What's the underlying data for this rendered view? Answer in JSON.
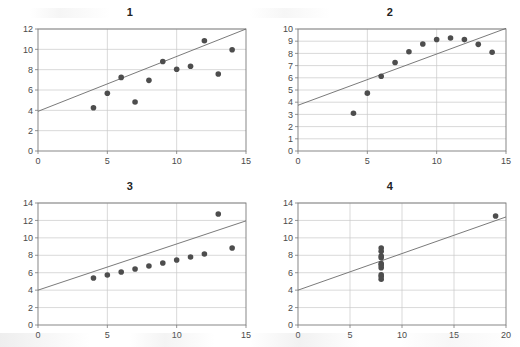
{
  "figure": {
    "name": "anscombes-quartet",
    "background_color": "#ffffff",
    "marker_color": "#4d4d4d",
    "line_color": "#6b6b6b",
    "grid_color": "#c8c8c8",
    "axis_color": "#7a7a7a"
  },
  "chart_data": [
    {
      "type": "scatter",
      "title": "1",
      "xlabel": "",
      "ylabel": "",
      "xlim": [
        0,
        15
      ],
      "ylim": [
        0,
        12
      ],
      "xticks": [
        0,
        5,
        10,
        15
      ],
      "yticks": [
        0,
        2,
        4,
        6,
        8,
        10,
        12
      ],
      "grid": true,
      "legend": "none",
      "x": [
        10,
        8,
        13,
        9,
        11,
        14,
        6,
        4,
        12,
        7,
        5
      ],
      "y": [
        8.04,
        6.95,
        7.58,
        8.81,
        8.33,
        9.96,
        7.24,
        4.26,
        10.84,
        4.82,
        5.68
      ],
      "fit_line": {
        "intercept": 3.9,
        "slope": 0.54,
        "x_from": 0,
        "x_to": 15
      }
    },
    {
      "type": "scatter",
      "title": "2",
      "xlabel": "",
      "ylabel": "",
      "xlim": [
        0,
        15
      ],
      "ylim": [
        0,
        10
      ],
      "xticks": [
        0,
        5,
        10,
        15
      ],
      "yticks": [
        0,
        1,
        2,
        3,
        4,
        5,
        6,
        7,
        8,
        9,
        10
      ],
      "grid": true,
      "legend": "none",
      "x": [
        10,
        8,
        13,
        9,
        11,
        14,
        6,
        4,
        12,
        7,
        5
      ],
      "y": [
        9.14,
        8.14,
        8.74,
        8.77,
        9.26,
        8.1,
        6.13,
        3.1,
        9.13,
        7.26,
        4.74
      ],
      "fit_line": {
        "intercept": 3.75,
        "slope": 0.42,
        "x_from": 0,
        "x_to": 15
      }
    },
    {
      "type": "scatter",
      "title": "3",
      "xlabel": "",
      "ylabel": "",
      "xlim": [
        0,
        15
      ],
      "ylim": [
        0,
        14
      ],
      "xticks": [
        0,
        5,
        10,
        15
      ],
      "yticks": [
        0,
        2,
        4,
        6,
        8,
        10,
        12,
        14
      ],
      "grid": true,
      "legend": "none",
      "x": [
        10,
        8,
        13,
        9,
        11,
        14,
        6,
        4,
        12,
        7,
        5
      ],
      "y": [
        7.46,
        6.77,
        12.74,
        7.11,
        7.81,
        8.84,
        6.08,
        5.39,
        8.15,
        6.42,
        5.73
      ],
      "fit_line": {
        "intercept": 4.0,
        "slope": 0.53,
        "x_from": 0,
        "x_to": 15
      }
    },
    {
      "type": "scatter",
      "title": "4",
      "xlabel": "",
      "ylabel": "",
      "xlim": [
        0,
        20
      ],
      "ylim": [
        0,
        14
      ],
      "xticks": [
        0,
        5,
        10,
        15,
        20
      ],
      "yticks": [
        0,
        2,
        4,
        6,
        8,
        10,
        12,
        14
      ],
      "grid": true,
      "legend": "none",
      "x": [
        8,
        8,
        8,
        8,
        8,
        8,
        8,
        19,
        8,
        8,
        8
      ],
      "y": [
        6.58,
        5.76,
        7.71,
        8.84,
        8.47,
        7.04,
        5.25,
        12.5,
        5.56,
        7.91,
        6.89
      ],
      "fit_line": {
        "intercept": 4.0,
        "slope": 0.42,
        "x_from": 0,
        "x_to": 20
      }
    }
  ]
}
